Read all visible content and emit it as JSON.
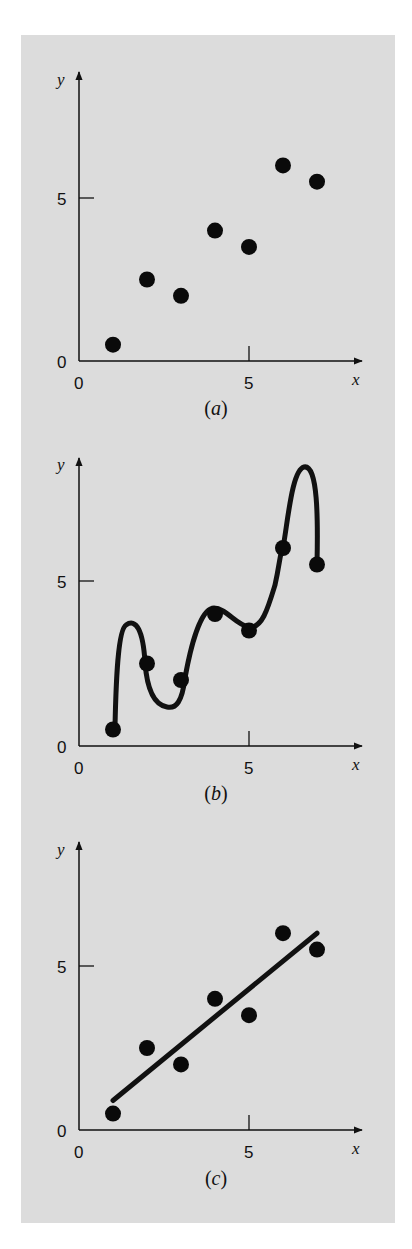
{
  "chart_data": [
    {
      "type": "scatter",
      "panel_label": "(a)",
      "caption_letter": "a",
      "xlabel": "x",
      "ylabel": "y",
      "x_ticks": [
        "0",
        "5"
      ],
      "y_ticks": [
        "0",
        "5"
      ],
      "xlim": [
        0,
        8
      ],
      "ylim": [
        0,
        8
      ],
      "grid": false,
      "x": [
        1,
        2,
        3,
        4,
        5,
        6,
        7
      ],
      "y": [
        0.5,
        2.5,
        2.0,
        4.0,
        3.5,
        6.0,
        5.5
      ]
    },
    {
      "type": "line",
      "panel_label": "(b)",
      "caption_letter": "b",
      "description": "Interpolating curve passing through every data point (oscillating)",
      "xlabel": "x",
      "ylabel": "y",
      "x_ticks": [
        "0",
        "5"
      ],
      "y_ticks": [
        "0",
        "5"
      ],
      "xlim": [
        0,
        8
      ],
      "ylim": [
        0,
        8
      ],
      "grid": false,
      "x": [
        1,
        2,
        3,
        4,
        5,
        6,
        7
      ],
      "y": [
        0.5,
        2.5,
        2.0,
        4.0,
        3.5,
        6.0,
        5.5
      ],
      "curve_extrema": [
        {
          "x": 1.6,
          "y": 3.8
        },
        {
          "x": 2.6,
          "y": 1.6
        },
        {
          "x": 6.5,
          "y": 8.3
        }
      ]
    },
    {
      "type": "scatter",
      "panel_label": "(c)",
      "caption_letter": "c",
      "description": "Data points with least-squares straight-line fit",
      "xlabel": "x",
      "ylabel": "y",
      "x_ticks": [
        "0",
        "5"
      ],
      "y_ticks": [
        "0",
        "5"
      ],
      "xlim": [
        0,
        8
      ],
      "ylim": [
        0,
        8
      ],
      "grid": false,
      "x": [
        1,
        2,
        3,
        4,
        5,
        6,
        7
      ],
      "y": [
        0.5,
        2.5,
        2.0,
        4.0,
        3.5,
        6.0,
        5.5
      ],
      "fit_line": {
        "x": [
          1,
          7
        ],
        "y": [
          0.9,
          6.0
        ]
      }
    }
  ],
  "labels": {
    "x_axis": "x",
    "y_axis": "y",
    "tick_zero": "0",
    "tick_five": "5",
    "cap_open": "(",
    "cap_close": ")"
  }
}
